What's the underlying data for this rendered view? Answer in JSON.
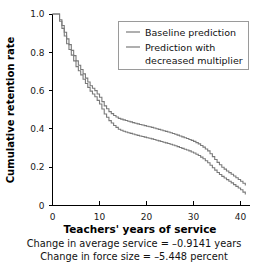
{
  "chart_data": {
    "type": "line",
    "title": "",
    "xlabel": "Teachers' years of service",
    "ylabel": "Cumulative retention rate",
    "xlim": [
      0,
      42
    ],
    "ylim": [
      0,
      1.0
    ],
    "xticks": [
      0,
      10,
      20,
      30,
      40
    ],
    "xtick_labels": [
      "0",
      "10",
      "20",
      "30",
      "40"
    ],
    "yticks": [
      0,
      0.2,
      0.4,
      0.6,
      0.8,
      1.0
    ],
    "ytick_labels": [
      "0",
      "0.2",
      "0.4",
      "0.6",
      "0.8",
      "1.0"
    ],
    "grid": false,
    "step": "post",
    "legend_position": "top-right",
    "series": [
      {
        "name": "Baseline prediction",
        "color": "#7a7a7a",
        "x": [
          0,
          1,
          2,
          3,
          4,
          5,
          6,
          7,
          8,
          9,
          10,
          11,
          12,
          13,
          14,
          15,
          16,
          17,
          18,
          19,
          20,
          21,
          22,
          23,
          24,
          25,
          26,
          27,
          28,
          29,
          30,
          31,
          32,
          33,
          34,
          35,
          36,
          37,
          38,
          39,
          40,
          41
        ],
        "values": [
          1.0,
          1.0,
          0.94,
          0.87,
          0.81,
          0.755,
          0.71,
          0.665,
          0.625,
          0.6,
          0.565,
          0.52,
          0.49,
          0.47,
          0.455,
          0.447,
          0.44,
          0.433,
          0.426,
          0.42,
          0.414,
          0.408,
          0.401,
          0.394,
          0.387,
          0.38,
          0.372,
          0.363,
          0.354,
          0.345,
          0.335,
          0.322,
          0.305,
          0.285,
          0.255,
          0.225,
          0.2,
          0.18,
          0.163,
          0.145,
          0.127,
          0.105
        ]
      },
      {
        "name": "Prediction with decreased multiplier",
        "color": "#7a7a7a",
        "x": [
          0,
          1,
          2,
          3,
          4,
          5,
          6,
          7,
          8,
          9,
          10,
          11,
          12,
          13,
          14,
          15,
          16,
          17,
          18,
          19,
          20,
          21,
          22,
          23,
          24,
          25,
          26,
          27,
          28,
          29,
          30,
          31,
          32,
          33,
          34,
          35,
          36,
          37,
          38,
          39,
          40,
          41
        ],
        "values": [
          1.0,
          1.0,
          0.925,
          0.845,
          0.785,
          0.725,
          0.682,
          0.637,
          0.597,
          0.568,
          0.53,
          0.478,
          0.443,
          0.418,
          0.398,
          0.388,
          0.38,
          0.373,
          0.366,
          0.36,
          0.354,
          0.348,
          0.341,
          0.334,
          0.327,
          0.32,
          0.312,
          0.303,
          0.294,
          0.285,
          0.274,
          0.261,
          0.244,
          0.223,
          0.197,
          0.172,
          0.152,
          0.135,
          0.118,
          0.1,
          0.082,
          0.058
        ]
      }
    ],
    "legend_entries": [
      "Baseline prediction",
      "Prediction with",
      "decreased multiplier"
    ],
    "annotations": [
      "Change in average service = –0.9141 years",
      "Change in force size = –5.448 percent"
    ]
  },
  "figure": {
    "background": "#ffffff",
    "axis_color": "#000000",
    "line_color": "#7a7a7a"
  }
}
